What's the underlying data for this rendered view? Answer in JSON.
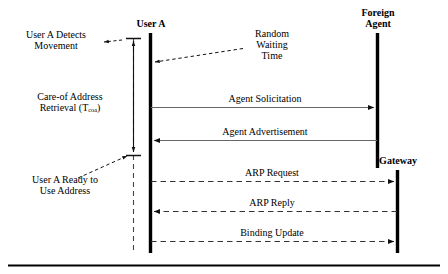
{
  "diagram": {
    "colors": {
      "ink": "#000000",
      "line": "#555555",
      "background": "#ffffff"
    },
    "actors": [
      {
        "id": "user-a",
        "label": "User A"
      },
      {
        "id": "foreign-agent",
        "label_line1": "Foreign",
        "label_line2": "Agent"
      },
      {
        "id": "gateway",
        "label": "Gateway"
      }
    ],
    "messages": [
      {
        "id": "agent-solicitation",
        "label": "Agent Solicitation",
        "style": "solid",
        "direction": "right"
      },
      {
        "id": "agent-advertisement",
        "label": "Agent Advertisement",
        "style": "solid",
        "direction": "left"
      },
      {
        "id": "arp-request",
        "label": "ARP Request",
        "style": "dashed",
        "direction": "right"
      },
      {
        "id": "arp-reply",
        "label": "ARP Reply",
        "style": "dashed",
        "direction": "left"
      },
      {
        "id": "binding-update",
        "label": "Binding Update",
        "style": "dashed",
        "direction": "right"
      }
    ],
    "annotations": {
      "detects_movement_line1": "User A Detects",
      "detects_movement_line2": "Movement",
      "random_wait_line1": "Random",
      "random_wait_line2": "Waiting",
      "random_wait_line3": "Time",
      "ready_line1": "User A Ready to",
      "ready_line2": "Use Address"
    },
    "phase": {
      "line1": "Care-of Address",
      "retrieval_text": "Retrieval (T",
      "subscript": "coa",
      "closing": ")"
    }
  }
}
